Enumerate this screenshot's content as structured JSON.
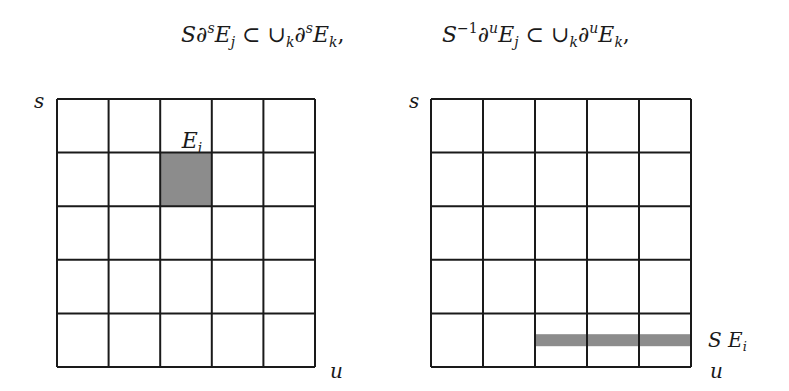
{
  "formulas": [
    {
      "lhs_op": "S",
      "lhs_partial": "∂",
      "lhs_sup": "s",
      "lhs_E": "E",
      "lhs_sub": "j",
      "rel": " ⊂ ",
      "union": "∪",
      "union_sub": "k",
      "rhs_partial": "∂",
      "rhs_sup": "s",
      "rhs_E": "E",
      "rhs_sub": "k",
      "tail": ","
    },
    {
      "lhs_op": "S",
      "lhs_op_sup": "−1",
      "lhs_partial": "∂",
      "lhs_sup": "u",
      "lhs_E": "E",
      "lhs_sub": "j",
      "rel": " ⊂ ",
      "union": "∪",
      "union_sub": "k",
      "rhs_partial": "∂",
      "rhs_sup": "u",
      "rhs_E": "E",
      "rhs_sub": "k",
      "tail": ","
    }
  ],
  "grids": [
    {
      "name": "left-grid",
      "rows": 5,
      "cols": 5,
      "axis_vertical_label": "s",
      "axis_horizontal_label": "u",
      "highlight": {
        "type": "cell",
        "row": 1,
        "col": 2,
        "label": "E",
        "label_sub": "i"
      },
      "highlight_color": "#8c8c8c"
    },
    {
      "name": "right-grid",
      "rows": 5,
      "cols": 5,
      "axis_vertical_label": "s",
      "axis_horizontal_label": "u",
      "highlight": {
        "type": "strip",
        "row": 4,
        "col_start": 2,
        "col_end": 4,
        "label": "S E",
        "label_sub": "i"
      },
      "highlight_color": "#8c8c8c"
    }
  ]
}
